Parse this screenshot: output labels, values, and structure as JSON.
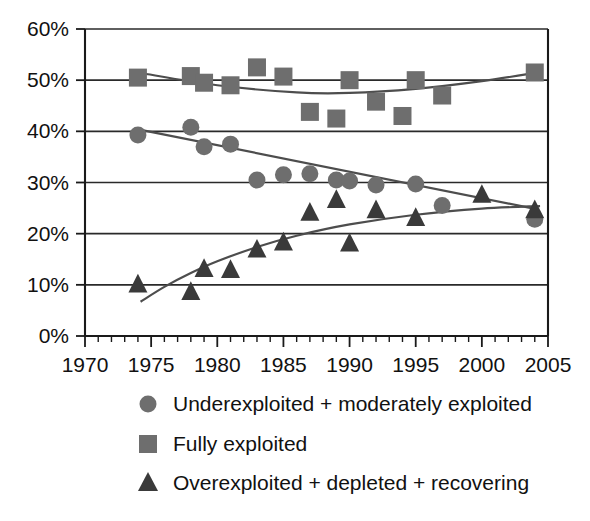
{
  "chart_data": {
    "type": "scatter",
    "title": "",
    "subtitle": "",
    "xlabel": "",
    "ylabel": "",
    "xlim": [
      1970,
      2005
    ],
    "ylim": [
      0,
      60
    ],
    "grid": true,
    "legend_position": "bottom",
    "x_ticks": [
      1970,
      1975,
      1980,
      1985,
      1990,
      1995,
      2000,
      2005
    ],
    "x_tick_labels": [
      "1970",
      "1975",
      "1980",
      "1985",
      "1990",
      "1995",
      "2000",
      "2005"
    ],
    "x_minor_tick_interval": 1,
    "y_ticks": [
      0,
      10,
      20,
      30,
      40,
      50,
      60
    ],
    "y_tick_labels": [
      "0%",
      "10%",
      "20%",
      "30%",
      "40%",
      "50%",
      "60%"
    ],
    "series": [
      {
        "name": "Underexploited + moderately exploited",
        "marker": "circle",
        "color": "#6e6e6e",
        "trend": "linear",
        "x": [
          1974,
          1978,
          1979,
          1981,
          1983,
          1985,
          1987,
          1989,
          1990,
          1992,
          1995,
          1997,
          2004
        ],
        "values": [
          39.3,
          40.8,
          37.0,
          37.5,
          30.5,
          31.5,
          31.7,
          30.5,
          30.3,
          29.5,
          29.7,
          25.5,
          22.8
        ],
        "trend_points": [
          [
            1974.4,
            40.2
          ],
          [
            2004.3,
            24.7
          ]
        ]
      },
      {
        "name": "Fully exploited",
        "marker": "square",
        "color": "#6e6e6e",
        "trend": "quadratic",
        "x": [
          1974,
          1978,
          1979,
          1981,
          1983,
          1985,
          1987,
          1989,
          1990,
          1992,
          1994,
          1995,
          1997,
          2004
        ],
        "values": [
          50.5,
          50.8,
          49.5,
          49.0,
          52.5,
          50.7,
          43.8,
          42.5,
          50.0,
          45.8,
          43.0,
          50.0,
          47.0,
          51.5
        ],
        "trend_points": [
          [
            1974.2,
            51.4
          ],
          [
            1980.0,
            49.0
          ],
          [
            1986.0,
            47.6
          ],
          [
            1990.0,
            47.5
          ],
          [
            1995.0,
            48.3
          ],
          [
            2000.0,
            49.8
          ],
          [
            2004.4,
            51.6
          ]
        ]
      },
      {
        "name": "Overexploited + depleted + recovering",
        "marker": "triangle",
        "color": "#3a3a3a",
        "trend": "logarithmic",
        "x": [
          1974,
          1978,
          1979,
          1981,
          1983,
          1985,
          1987,
          1989,
          1990,
          1992,
          1995,
          2000,
          2004
        ],
        "values": [
          10.0,
          8.5,
          13.0,
          12.8,
          16.8,
          18.2,
          24.0,
          26.5,
          18.0,
          24.5,
          23.0,
          27.5,
          24.5
        ],
        "trend_points": [
          [
            1974.2,
            6.7
          ],
          [
            1976.0,
            9.6
          ],
          [
            1978.0,
            12.3
          ],
          [
            1980.0,
            14.6
          ],
          [
            1983.0,
            17.4
          ],
          [
            1986.0,
            19.6
          ],
          [
            1990.0,
            21.8
          ],
          [
            1995.0,
            23.7
          ],
          [
            2000.0,
            24.9
          ],
          [
            2004.4,
            25.4
          ]
        ]
      }
    ]
  },
  "legend": {
    "entries": [
      {
        "marker": "circle",
        "label": "Underexploited + moderately exploited"
      },
      {
        "marker": "square",
        "label": "Fully exploited"
      },
      {
        "marker": "triangle",
        "label": "Overexploited + depleted + recovering"
      }
    ]
  },
  "colors": {
    "marker_light": "#6e6e6e",
    "marker_dark": "#3a3a3a",
    "axis": "#1a1a1a",
    "background": "#ffffff"
  }
}
